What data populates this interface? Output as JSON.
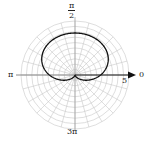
{
  "chart_data": {
    "type": "polar-line",
    "title": "",
    "equation_form": "r = 2 + 2 sin(θ)",
    "curve": "cardioid",
    "radial_max": 5,
    "radial_label": "5",
    "ring_step": 0.5,
    "angular_spokes_deg": 15,
    "angle_labels": {
      "right": "0",
      "top_num": "π",
      "top_den": "2",
      "left": "π",
      "bottom_num": "3π",
      "bottom_den": "2"
    },
    "grid": true,
    "colors": {
      "grid": "#c8c8c8",
      "curve": "#111111",
      "axis": "#111111"
    }
  }
}
